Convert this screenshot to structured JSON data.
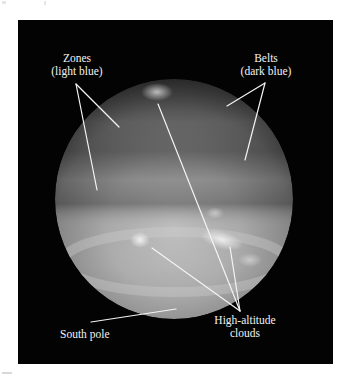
{
  "figure": {
    "background_color": "#030303",
    "label_color": "#f2f2f2",
    "leader_line_color": "#f4f4f4"
  },
  "labels": {
    "zones": {
      "line1": "Zones",
      "line2": "(light blue)"
    },
    "belts": {
      "line1": "Belts",
      "line2": "(dark blue)"
    },
    "south_pole": {
      "line1": "South pole"
    },
    "high_altitude_clouds": {
      "line1": "High-altitude",
      "line2": "clouds"
    }
  }
}
